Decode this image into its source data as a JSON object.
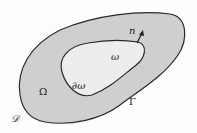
{
  "diagram": {
    "type": "domain-diagram",
    "regions": [
      {
        "name": "outer-domain",
        "label": "Ω",
        "fill": "#cfcfcf"
      },
      {
        "name": "inner-hole",
        "label": "ω",
        "fill": "#ededed"
      }
    ],
    "boundaries": [
      {
        "name": "outer-boundary",
        "label": "Γ"
      },
      {
        "name": "inner-boundary",
        "label": "∂ω"
      }
    ],
    "normal_vector": {
      "label": "n"
    },
    "container": {
      "label": "𝒟"
    },
    "colors": {
      "stroke": "#2a2a2a",
      "outer_fill": "#cfcfcf",
      "inner_fill": "#ededed",
      "background": "#fdfdfd"
    }
  }
}
